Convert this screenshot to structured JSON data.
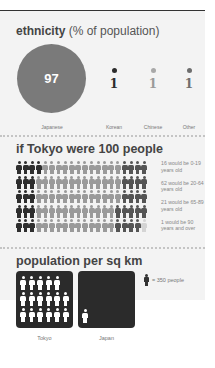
{
  "ethnicity": {
    "title_bold": "ethnicity",
    "title_rest": " (% of population)",
    "items": [
      {
        "label": "Japanese",
        "value": "97",
        "color": "#7a7a7a"
      },
      {
        "label": "Korean",
        "value": "1",
        "color": "#2b2b2b"
      },
      {
        "label": "Chinese",
        "value": "1",
        "color": "#a8a8a8"
      },
      {
        "label": "Other",
        "value": "1",
        "color": "#6e6e6e"
      }
    ]
  },
  "people": {
    "title": "if Tokyo were 100 people",
    "groups": [
      {
        "count": 16,
        "text": "16 would be 0-19 years old",
        "color": "#2e2e2e"
      },
      {
        "count": 62,
        "text": "62 would be 20-64 years old",
        "color": "#9a9a9a"
      },
      {
        "count": 21,
        "text": "21 would be 65-89 years old",
        "color": "#555555"
      },
      {
        "count": 1,
        "text": "1 would be 90 years and over",
        "color": "#d4d4d4"
      }
    ]
  },
  "density": {
    "title": "population per sq km",
    "key_text": "= 350 people",
    "boxes": [
      {
        "label": "Tokyo",
        "rows": [
          5,
          6,
          6
        ]
      },
      {
        "label": "Japan",
        "rows": [
          1
        ]
      }
    ]
  }
}
